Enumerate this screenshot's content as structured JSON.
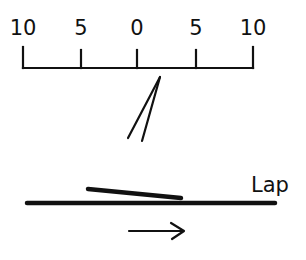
{
  "scale": {
    "labels": [
      "10",
      "5",
      "0",
      "5",
      "10"
    ],
    "tick_x": [
      23,
      81,
      137,
      196,
      253
    ],
    "baseline_y": 68
  },
  "diagram": {
    "lap_label": "Lap",
    "arrow_direction": "right",
    "ink_color": "#111111"
  }
}
